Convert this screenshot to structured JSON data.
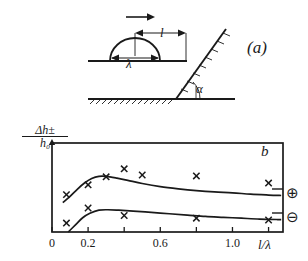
{
  "figure": {
    "panel_a": {
      "label": "(a)",
      "schematic_labels": {
        "wavelength": "λ",
        "distance": "l",
        "angle": "α"
      },
      "arrow_direction": "right",
      "description_elements": [
        "motion-arrow",
        "hump",
        "horizontal-surface",
        "inclined-wall",
        "hatched-ground"
      ]
    },
    "panel_b": {
      "label": "b",
      "y_axis_label_numerator": "Δh±",
      "y_axis_label_denominator": "h₀",
      "x_axis_label": "l/λ",
      "legend": {
        "plus": "⊕",
        "minus": "⊖"
      }
    }
  },
  "chart_data": {
    "type": "line",
    "title": "",
    "xlabel": "l/λ",
    "ylabel": "Δh±/h₀",
    "xlim": [
      0,
      1.28
    ],
    "ylim": [
      0,
      1.0
    ],
    "xticks": [
      0,
      0.2,
      0.4,
      0.6,
      0.8,
      1.0,
      1.2
    ],
    "xtick_labels": [
      "0",
      "0.2",
      "",
      "0.6",
      "",
      "1.0",
      ""
    ],
    "yticks": [],
    "ytick_labels": [],
    "grid": false,
    "legend_position": "right-outside",
    "series": [
      {
        "name": "⊕",
        "marker": "x",
        "curve_x": [
          0.06,
          0.1,
          0.14,
          0.18,
          0.22,
          0.26,
          0.3,
          0.36,
          0.42,
          0.5,
          0.6,
          0.7,
          0.8,
          0.9,
          1.0,
          1.1,
          1.2,
          1.27
        ],
        "curve_y": [
          0.33,
          0.4,
          0.48,
          0.55,
          0.6,
          0.625,
          0.625,
          0.605,
          0.58,
          0.545,
          0.51,
          0.485,
          0.465,
          0.45,
          0.44,
          0.425,
          0.415,
          0.41
        ],
        "points_x": [
          0.08,
          0.2,
          0.3,
          0.4,
          0.5,
          0.8,
          1.2
        ],
        "points_y": [
          0.42,
          0.53,
          0.62,
          0.71,
          0.64,
          0.63,
          0.55
        ]
      },
      {
        "name": "⊖",
        "marker": "x",
        "curve_x": [
          0.09,
          0.13,
          0.17,
          0.21,
          0.26,
          0.31,
          0.37,
          0.45,
          0.55,
          0.65,
          0.75,
          0.85,
          0.95,
          1.05,
          1.15,
          1.25,
          1.27
        ],
        "curve_y": [
          0.0,
          0.08,
          0.16,
          0.21,
          0.245,
          0.25,
          0.245,
          0.235,
          0.22,
          0.205,
          0.19,
          0.175,
          0.165,
          0.155,
          0.145,
          0.14,
          0.14
        ],
        "points_x": [
          0.08,
          0.2,
          0.4,
          0.8,
          1.2
        ],
        "points_y": [
          0.1,
          0.27,
          0.185,
          0.155,
          0.135
        ]
      }
    ]
  }
}
